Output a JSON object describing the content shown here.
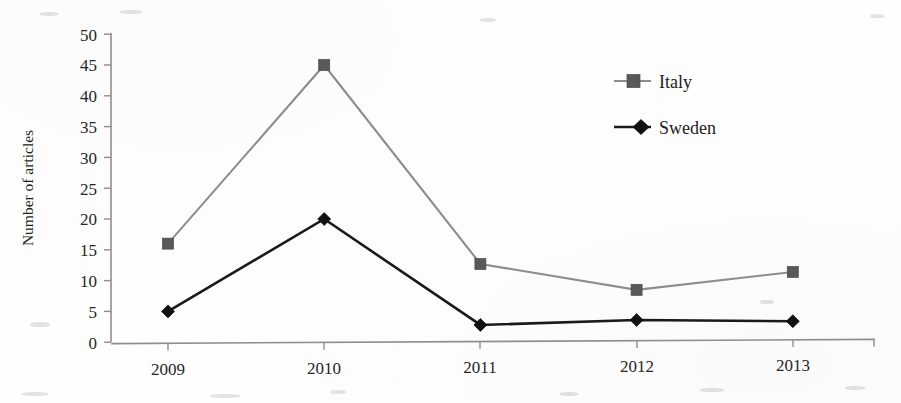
{
  "chart_data": {
    "type": "line",
    "title": "",
    "xlabel": "",
    "ylabel": "Number of articles",
    "categories": [
      "2009",
      "2010",
      "2011",
      "2012",
      "2013"
    ],
    "ylim": [
      0,
      50
    ],
    "yticks": [
      0,
      5,
      10,
      15,
      20,
      25,
      30,
      35,
      40,
      45,
      50
    ],
    "ytick_labels": [
      "0",
      "5",
      "10",
      "15",
      "20",
      "25",
      "30",
      "35",
      "40",
      "45",
      "50"
    ],
    "grid": false,
    "legend_position": "upper-right-inside",
    "series": [
      {
        "name": "Italy",
        "values": [
          16,
          45,
          12.7,
          8.5,
          11.4
        ],
        "color": "#8d8d8d",
        "marker": "square",
        "marker_color": "#595959"
      },
      {
        "name": "Sweden",
        "values": [
          5,
          20,
          2.8,
          3.6,
          3.4
        ],
        "color": "#1a1a1a",
        "marker": "diamond",
        "marker_color": "#111111"
      }
    ]
  },
  "axes": {
    "y_axis_label": "Number of articles",
    "y_tick_0": "0",
    "y_tick_5": "5",
    "y_tick_10": "10",
    "y_tick_15": "15",
    "y_tick_20": "20",
    "y_tick_25": "25",
    "y_tick_30": "30",
    "y_tick_35": "35",
    "y_tick_40": "40",
    "y_tick_45": "45",
    "y_tick_50": "50",
    "x_tick_0": "2009",
    "x_tick_1": "2010",
    "x_tick_2": "2011",
    "x_tick_3": "2012",
    "x_tick_4": "2013"
  },
  "legend": {
    "entry_0_label": "Italy",
    "entry_1_label": "Sweden"
  }
}
